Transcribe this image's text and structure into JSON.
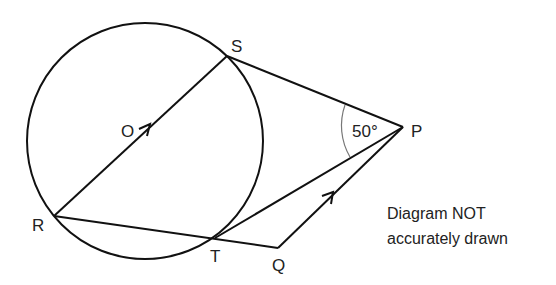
{
  "diagram": {
    "points": {
      "S": {
        "label": "S",
        "x": 227,
        "y": 56,
        "lx": 231,
        "ly": 52
      },
      "P": {
        "label": "P",
        "x": 403,
        "y": 127,
        "lx": 411,
        "ly": 136
      },
      "R": {
        "label": "R",
        "x": 54,
        "y": 216,
        "lx": 33,
        "ly": 231
      },
      "T": {
        "label": "T",
        "x": 215,
        "y": 238,
        "lx": 210,
        "ly": 262
      },
      "Q": {
        "label": "Q",
        "x": 278,
        "y": 248,
        "lx": 272,
        "ly": 271
      },
      "O": {
        "label": "O",
        "x": 145,
        "y": 141,
        "lx": 121,
        "ly": 136
      }
    },
    "circle": {
      "cx": 145,
      "cy": 141,
      "r": 118
    },
    "angle_label": "50°",
    "note_line1": "Diagram NOT",
    "note_line2": "accurately drawn",
    "stroke_color": "#111111",
    "arc_color": "#777777"
  }
}
